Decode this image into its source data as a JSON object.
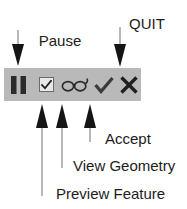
{
  "figure": {
    "kind": "toolbar-annotation-diagram",
    "background_color": "#ffffff",
    "text_color": "#1c1c1c",
    "toolbar_color": "#b9b9b9",
    "icon_color": "#2b2b2b"
  },
  "callouts": {
    "pause_creation": {
      "line1": "Pause",
      "line2": "Creation",
      "points_to": "pause-button",
      "direction": "down"
    },
    "quit": {
      "text": "QUIT",
      "points_to": "quit-button",
      "direction": "down"
    },
    "accept": {
      "text": "Accept",
      "points_to": "accept-button",
      "direction": "up"
    },
    "view_geometry": {
      "text": "View Geometry",
      "points_to": "view-geometry-button",
      "direction": "up"
    },
    "preview_feature": {
      "text": "Preview Feature",
      "points_to": "preview-feature-checkbox",
      "direction": "up"
    }
  },
  "toolbar": {
    "buttons": [
      {
        "name": "pause-button",
        "icon": "pause-icon",
        "label": "Pause Creation",
        "state": "enabled"
      },
      {
        "name": "preview-feature-checkbox",
        "icon": "checkbox-checked-icon",
        "label": "Preview Feature",
        "state": "checked"
      },
      {
        "name": "view-geometry-button",
        "icon": "glasses-icon",
        "label": "View Geometry",
        "state": "enabled"
      },
      {
        "name": "accept-button",
        "icon": "checkmark-icon",
        "label": "Accept",
        "state": "enabled"
      },
      {
        "name": "quit-button",
        "icon": "x-cross-icon",
        "label": "QUIT",
        "state": "enabled"
      }
    ]
  }
}
